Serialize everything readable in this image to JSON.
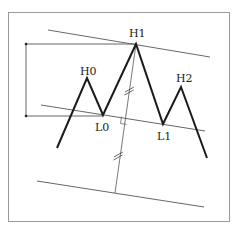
{
  "diagram": {
    "title": "",
    "labels": {
      "H0": "H0",
      "H1": "H1",
      "H2": "H2",
      "L0": "L0",
      "L1": "L1"
    },
    "price_path_points": [
      "start",
      "H0",
      "L0",
      "H1",
      "L1",
      "H2",
      "end"
    ],
    "reference_lines": [
      "upper-channel-line",
      "middle-neckline",
      "lower-projected-line"
    ],
    "annotations": {
      "height_bracket": "distance between H1 and L0 levels",
      "perpendicular": "perpendicular from H1 to neckline, extended equal length below",
      "equal_length_marks": 2,
      "right_angle_marker": true
    },
    "colors": {
      "path": "#1a1a1a",
      "thin_lines": "#555555",
      "frame": "#999999"
    }
  }
}
